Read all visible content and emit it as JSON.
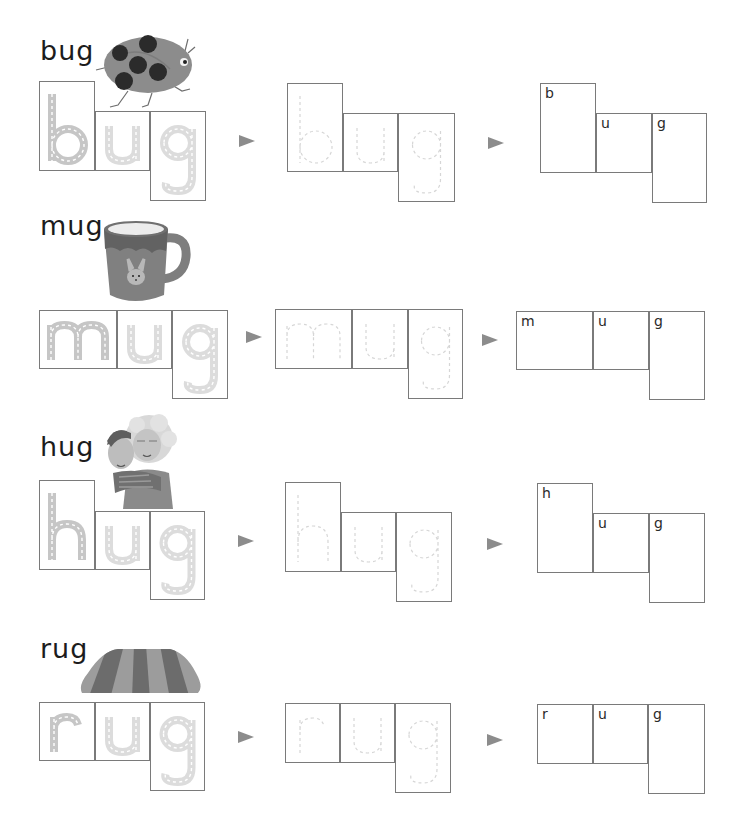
{
  "worksheet": {
    "colors": {
      "border": "#7a7a7a",
      "arrow": "#8c8c8c",
      "trace_dark": "#c6c6c6",
      "trace_light": "#dcdcdc",
      "dash_light": "#d6d6d6",
      "text": "#1c1c1c"
    },
    "rows": [
      {
        "word": "bug",
        "picture": "ladybug",
        "title_pos": [
          40,
          37
        ],
        "letters": [
          "b",
          "u",
          "g"
        ],
        "groups": [
          {
            "mode": "thick",
            "boxes": [
              [
                39,
                81,
                56,
                90
              ],
              [
                95,
                111,
                55,
                60
              ],
              [
                150,
                111,
                56,
                90
              ]
            ]
          },
          {
            "mode": "dashed",
            "boxes": [
              [
                287,
                83,
                56,
                89
              ],
              [
                343,
                113,
                55,
                59
              ],
              [
                398,
                113,
                57,
                89
              ]
            ]
          },
          {
            "mode": "label",
            "boxes": [
              [
                540,
                83,
                56,
                90
              ],
              [
                596,
                113,
                56,
                60
              ],
              [
                652,
                113,
                55,
                90
              ]
            ]
          }
        ],
        "arrows": [
          [
            239,
            135
          ],
          [
            488,
            137
          ]
        ]
      },
      {
        "word": "mug",
        "picture": "mug",
        "title_pos": [
          40,
          212
        ],
        "letters": [
          "m",
          "u",
          "g"
        ],
        "groups": [
          {
            "mode": "thick",
            "boxes": [
              [
                39,
                310,
                78,
                59
              ],
              [
                117,
                310,
                55,
                59
              ],
              [
                172,
                310,
                56,
                89
              ]
            ]
          },
          {
            "mode": "dashed",
            "boxes": [
              [
                275,
                309,
                77,
                60
              ],
              [
                352,
                309,
                56,
                60
              ],
              [
                408,
                309,
                55,
                90
              ]
            ]
          },
          {
            "mode": "label",
            "boxes": [
              [
                516,
                311,
                77,
                59
              ],
              [
                593,
                311,
                56,
                59
              ],
              [
                649,
                311,
                56,
                89
              ]
            ]
          }
        ],
        "arrows": [
          [
            246,
            331
          ],
          [
            482,
            334
          ]
        ]
      },
      {
        "word": "hug",
        "picture": "hug",
        "title_pos": [
          40,
          433
        ],
        "letters": [
          "h",
          "u",
          "g"
        ],
        "groups": [
          {
            "mode": "thick",
            "boxes": [
              [
                39,
                480,
                56,
                90
              ],
              [
                95,
                511,
                55,
                59
              ],
              [
                150,
                511,
                55,
                89
              ]
            ]
          },
          {
            "mode": "dashed",
            "boxes": [
              [
                285,
                482,
                56,
                90
              ],
              [
                341,
                512,
                55,
                60
              ],
              [
                396,
                512,
                56,
                90
              ]
            ]
          },
          {
            "mode": "label",
            "boxes": [
              [
                537,
                483,
                56,
                90
              ],
              [
                593,
                513,
                56,
                60
              ],
              [
                649,
                513,
                56,
                90
              ]
            ]
          }
        ],
        "arrows": [
          [
            238,
            535
          ],
          [
            487,
            538
          ]
        ]
      },
      {
        "word": "rug",
        "picture": "rug",
        "title_pos": [
          40,
          635
        ],
        "letters": [
          "r",
          "u",
          "g"
        ],
        "groups": [
          {
            "mode": "thick",
            "boxes": [
              [
                39,
                702,
                56,
                59
              ],
              [
                95,
                702,
                55,
                59
              ],
              [
                150,
                702,
                55,
                89
              ]
            ]
          },
          {
            "mode": "dashed",
            "boxes": [
              [
                285,
                703,
                55,
                60
              ],
              [
                340,
                703,
                55,
                60
              ],
              [
                395,
                703,
                56,
                90
              ]
            ]
          },
          {
            "mode": "label",
            "boxes": [
              [
                537,
                704,
                56,
                60
              ],
              [
                593,
                704,
                55,
                60
              ],
              [
                648,
                704,
                57,
                90
              ]
            ]
          }
        ],
        "arrows": [
          [
            238,
            731
          ],
          [
            487,
            734
          ]
        ]
      }
    ]
  }
}
